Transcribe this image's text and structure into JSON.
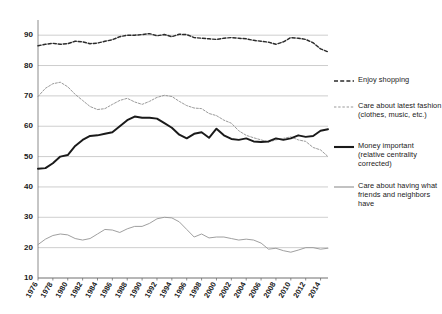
{
  "chart_data": {
    "type": "line",
    "title": "",
    "subtitle": "",
    "xlabel": "",
    "ylabel": "",
    "xlim": [
      1976,
      2015
    ],
    "ylim": [
      10,
      95
    ],
    "yticks": [
      10,
      20,
      30,
      40,
      50,
      60,
      70,
      80,
      90
    ],
    "xticks": [
      1976,
      1978,
      1980,
      1982,
      1984,
      1986,
      1988,
      1990,
      1992,
      1994,
      1996,
      1998,
      2000,
      2002,
      2004,
      2006,
      2008,
      2010,
      2012,
      2014
    ],
    "grid": true,
    "legend_position": "right",
    "x": [
      1976,
      1977,
      1978,
      1979,
      1980,
      1981,
      1982,
      1983,
      1984,
      1985,
      1986,
      1987,
      1988,
      1989,
      1990,
      1991,
      1992,
      1993,
      1994,
      1995,
      1996,
      1997,
      1998,
      1999,
      2000,
      2001,
      2002,
      2003,
      2004,
      2005,
      2006,
      2007,
      2008,
      2009,
      2010,
      2011,
      2012,
      2013,
      2014,
      2015
    ],
    "series": [
      {
        "name": "Enjoy shopping",
        "style": "dashed-dark",
        "color": "#2b2b2b",
        "values": [
          86.5,
          87.0,
          87.3,
          87.0,
          87.2,
          88.0,
          87.8,
          87.2,
          87.4,
          88.0,
          88.5,
          89.5,
          90.0,
          90.0,
          90.2,
          90.5,
          89.8,
          90.2,
          89.5,
          90.3,
          90.2,
          89.2,
          89.0,
          88.8,
          88.6,
          89.0,
          89.2,
          89.0,
          88.8,
          88.3,
          88.0,
          87.7,
          87.0,
          87.8,
          89.2,
          89.0,
          88.6,
          87.5,
          85.5,
          84.5
        ]
      },
      {
        "name": "Care about latest fashion (clothes, music, etc.)",
        "style": "dashed-light",
        "color": "#9a9a9a",
        "values": [
          69.8,
          72.5,
          74.0,
          74.5,
          73.0,
          70.5,
          68.5,
          66.5,
          65.5,
          65.8,
          67.2,
          68.5,
          69.2,
          68.0,
          67.2,
          68.2,
          69.5,
          70.2,
          69.8,
          68.2,
          66.8,
          66.0,
          65.8,
          64.2,
          63.5,
          62.0,
          61.0,
          58.5,
          57.0,
          56.2,
          55.5,
          54.8,
          55.5,
          56.0,
          56.5,
          55.5,
          55.0,
          53.0,
          52.2,
          50.0
        ]
      },
      {
        "name": "Money important (relative centrality corrected)",
        "style": "solid-thick",
        "color": "#1a1a1a",
        "values": [
          46.0,
          46.2,
          47.8,
          50.0,
          50.5,
          53.5,
          55.5,
          56.8,
          57.0,
          57.5,
          58.0,
          60.0,
          62.0,
          63.2,
          62.8,
          62.8,
          62.5,
          61.0,
          59.5,
          57.2,
          56.0,
          57.5,
          58.0,
          56.2,
          59.2,
          57.0,
          55.8,
          55.5,
          56.0,
          55.0,
          54.8,
          55.0,
          56.0,
          55.5,
          56.0,
          57.0,
          56.5,
          56.8,
          58.5,
          59.0
        ]
      },
      {
        "name": "Care about having what friends and neighbors have",
        "style": "solid-thin",
        "color": "#9a9a9a",
        "values": [
          21.0,
          22.8,
          24.0,
          24.5,
          24.2,
          23.0,
          22.5,
          23.0,
          24.5,
          26.0,
          25.8,
          25.0,
          26.2,
          27.0,
          27.0,
          28.0,
          29.5,
          30.0,
          29.8,
          28.5,
          26.0,
          23.5,
          24.5,
          23.2,
          23.5,
          23.5,
          23.0,
          22.5,
          22.8,
          22.5,
          21.5,
          19.5,
          19.8,
          19.0,
          18.5,
          19.2,
          20.0,
          20.0,
          19.5,
          19.8
        ]
      }
    ]
  },
  "legend": {
    "items": [
      {
        "label": "Enjoy shopping",
        "swatch": "dashed-dark-swatch"
      },
      {
        "label": "Care about latest fashion (clothes, music, etc.)",
        "swatch": "dashed-light-swatch"
      },
      {
        "label": "Money important (relative centrality corrected)",
        "swatch": "solid-thick-swatch"
      },
      {
        "label": "Care about having what friends and neighbors have",
        "swatch": "solid-thin-swatch"
      }
    ]
  }
}
